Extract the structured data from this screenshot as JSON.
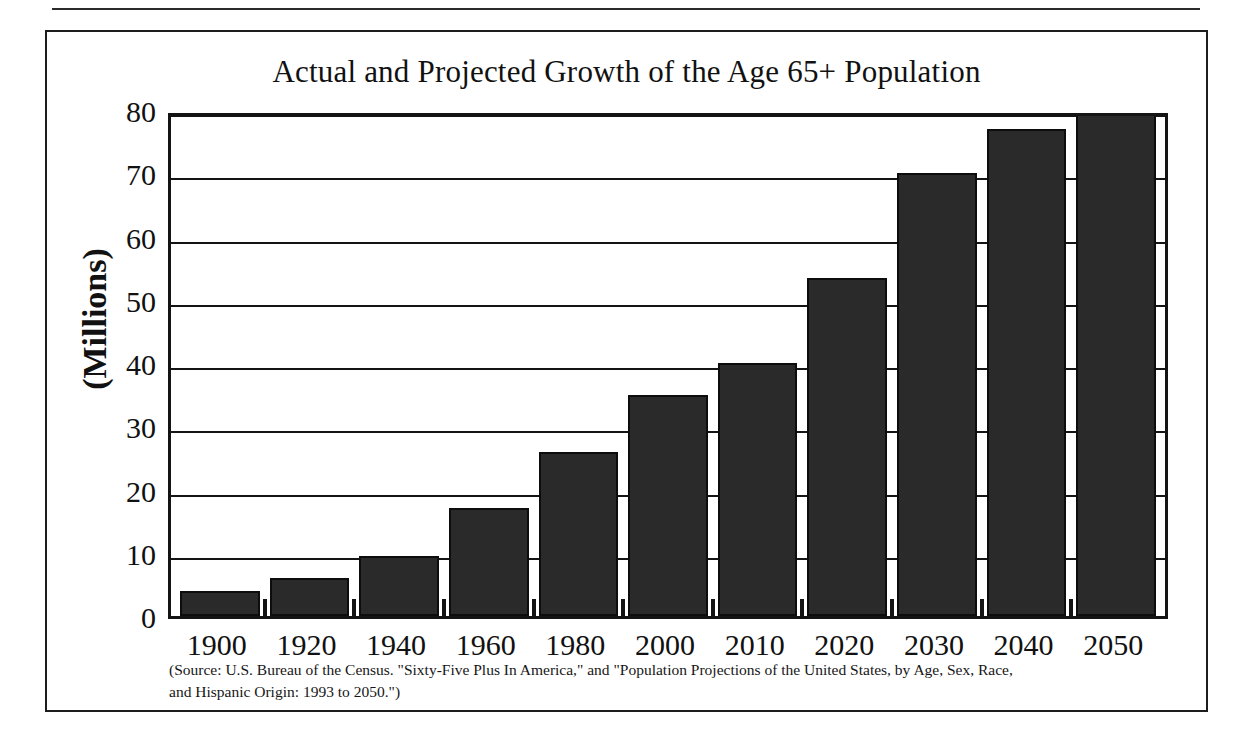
{
  "figure": {
    "title": "Actual and Projected Growth of the Age 65+ Population",
    "y_axis_caption": "(Millions)",
    "source_line_1": "(Source:  U.S. Bureau of the Census.  \"Sixty-Five Plus In America,\" and \"Population Projections of the United States, by Age, Sex, Race,",
    "source_line_2": "and Hispanic Origin:  1993 to 2050.\")",
    "bar_color": "#2a2a2a",
    "frame_color": "#141414",
    "background_color": "#ffffff"
  },
  "chart_data": {
    "type": "bar",
    "title": "Actual and Projected Growth of the Age 65+ Population",
    "xlabel": "",
    "ylabel": "(Millions)",
    "categories": [
      "1900",
      "1920",
      "1940",
      "1960",
      "1980",
      "2000",
      "2010",
      "2020",
      "2030",
      "2040",
      "2050"
    ],
    "values": [
      4.0,
      6.0,
      9.5,
      17.0,
      26.0,
      35.0,
      40.0,
      53.5,
      70.0,
      77.0,
      80.0
    ],
    "ylim": [
      0,
      80
    ],
    "yticks": [
      0,
      10,
      20,
      30,
      40,
      50,
      60,
      70,
      80
    ],
    "ytick_labels": [
      "0",
      "10",
      "20",
      "30",
      "40",
      "50",
      "60",
      "70",
      "80"
    ],
    "grid": true,
    "legend": false,
    "annotations": [
      "(Source:  U.S. Bureau of the Census.  \"Sixty-Five Plus In America,\" and \"Population Projections of the United States, by Age, Sex, Race,",
      "and Hispanic Origin:  1993 to 2050.\")"
    ]
  }
}
